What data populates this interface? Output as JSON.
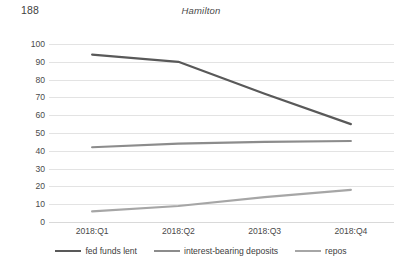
{
  "page": {
    "page_number": "188"
  },
  "chart_data": {
    "type": "line",
    "title": "Hamilton",
    "xlabel": "",
    "ylabel": "",
    "categories": [
      "2018:Q1",
      "2018:Q2",
      "2018:Q3",
      "2018:Q4"
    ],
    "ylim": [
      0,
      100
    ],
    "yticks": [
      0,
      10,
      20,
      30,
      40,
      50,
      60,
      70,
      80,
      90,
      100
    ],
    "ytick_labels": [
      "0",
      "10",
      "20",
      "30",
      "40",
      "50",
      "60",
      "70",
      "80",
      "90",
      "100"
    ],
    "grid": true,
    "legend_position": "bottom",
    "series": [
      {
        "name": "fed funds lent",
        "color": "#595959",
        "values": [
          94,
          90,
          72,
          55
        ]
      },
      {
        "name": "interest-bearing deposits",
        "color": "#8c8c8c",
        "values": [
          42,
          44,
          45,
          45.5
        ]
      },
      {
        "name": "repos",
        "color": "#a6a6a6",
        "values": [
          6,
          9,
          14,
          18
        ]
      }
    ]
  }
}
